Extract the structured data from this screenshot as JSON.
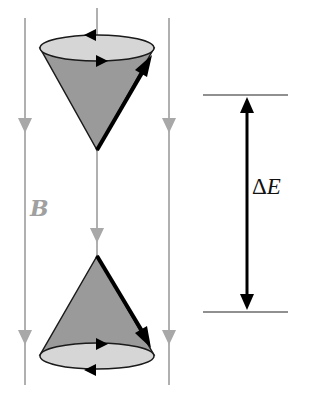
{
  "diagram": {
    "type": "spin-precession-energy-levels",
    "labels": {
      "field": "B",
      "energy_delta_symbol": "Δ",
      "energy_delta_var": "E"
    },
    "components": [
      {
        "name": "upper-cone",
        "orientation": "apex-down",
        "description": "spin precessing, moment pointing up"
      },
      {
        "name": "lower-cone",
        "orientation": "apex-up",
        "description": "spin precessing, moment pointing down"
      },
      {
        "name": "field-lines",
        "count": 3,
        "direction": "down"
      },
      {
        "name": "energy-gap-arrow",
        "direction": "double-headed"
      }
    ],
    "colors": {
      "field_line": "#a8a8a8",
      "cone_body": "#9a9a9a",
      "cone_base": "#d6d6d6",
      "outline": "#1a1a1a",
      "spin_vector": "#000000",
      "label_b": "#a0a0a0"
    }
  }
}
